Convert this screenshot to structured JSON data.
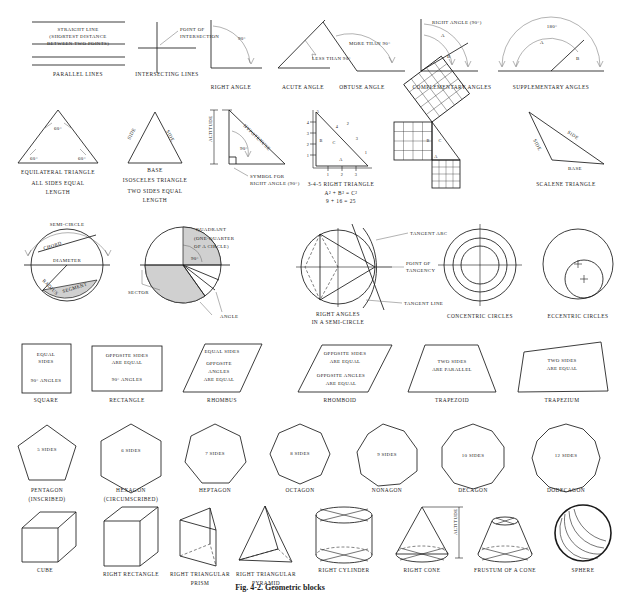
{
  "plate": {
    "caption": "Fig. 4-2. Geometric blocks",
    "background": "#ffffff",
    "ink": "#1a1a1a",
    "shade": "#d0d0d0"
  },
  "row1": {
    "name": "lines-and-angles",
    "items": [
      {
        "id": "parallel-lines",
        "caption": "PARALLEL LINES",
        "labels": [
          "STRAIGHT LINE",
          "(SHORTEST DISTANCE",
          "BETWEEN TWO POINTS)"
        ]
      },
      {
        "id": "intersecting-lines",
        "caption": "INTERSECTING LINES",
        "labels": [
          "POINT OF",
          "INTERSECTION"
        ]
      },
      {
        "id": "right-angle",
        "caption": "RIGHT ANGLE",
        "labels": [
          "90°"
        ]
      },
      {
        "id": "acute-angle",
        "caption": "ACUTE ANGLE",
        "labels": [
          "LESS THAN 90°"
        ]
      },
      {
        "id": "obtuse-angle",
        "caption": "OBTUSE ANGLE",
        "labels": [
          "MORE THAN 90°"
        ]
      },
      {
        "id": "complementary-angles",
        "caption": "COMPLEMENTARY ANGLES",
        "labels": [
          "RIGHT ANGLE (90°)",
          "A",
          "B"
        ]
      },
      {
        "id": "supplementary-angles",
        "caption": "SUPPLEMENTARY ANGLES",
        "labels": [
          "180°",
          "A",
          "B"
        ]
      }
    ]
  },
  "row2": {
    "name": "triangles",
    "items": [
      {
        "id": "equilateral-triangle",
        "caption": "EQUILATERAL TRIANGLE",
        "sub": [
          "ALL SIDES EQUAL",
          "LENGTH"
        ],
        "labels": [
          "60°",
          "60°",
          "60°"
        ]
      },
      {
        "id": "isosceles-triangle",
        "caption": "ISOSCELES TRIANGLE",
        "sub": [
          "TWO SIDES EQUAL",
          "LENGTH"
        ],
        "labels": [
          "SIDE",
          "SIDE",
          "BASE"
        ]
      },
      {
        "id": "right-triangle-altitude",
        "caption": "",
        "labels": [
          "ALTITUDE",
          "HYPOTENUSE",
          "90°",
          "SYMBOL FOR",
          "RIGHT ANGLE (90°)"
        ]
      },
      {
        "id": "three-four-five-right-triangle",
        "caption": "3-4-5 RIGHT TRIANGLE",
        "sub": [
          "A² + B² = C²",
          "9 + 16 = 25"
        ],
        "labels": [
          "A",
          "B",
          "C",
          "1",
          "2",
          "3",
          "4",
          "5"
        ]
      },
      {
        "id": "pythagorean-squares",
        "caption": "",
        "labels": [
          "A",
          "B",
          "C"
        ]
      },
      {
        "id": "scalene-triangle",
        "caption": "SCALENE TRIANGLE",
        "labels": [
          "SIDE",
          "SIDE",
          "BASE"
        ]
      }
    ]
  },
  "row3": {
    "name": "circles",
    "items": [
      {
        "id": "circle-parts",
        "caption": "",
        "labels": [
          "SEMI-CIRCLE",
          "CHORD",
          "DIAMETER",
          "RADIUS",
          "SEGMENT"
        ]
      },
      {
        "id": "circle-sectors",
        "caption": "",
        "labels": [
          "QUADRANT",
          "(ONE-QUARTER",
          "OF A CIRCLE)",
          "90°",
          "SECTOR",
          "ANGLE"
        ]
      },
      {
        "id": "tangents",
        "caption": "RIGHT ANGLES",
        "sub": [
          "IN A SEMI-CIRCLE"
        ],
        "labels": [
          "TANGENT ARC",
          "POINT OF",
          "TANGENCY",
          "TANGENT LINE"
        ]
      },
      {
        "id": "concentric-circles",
        "caption": "CONCENTRIC CIRCLES",
        "labels": []
      },
      {
        "id": "eccentric-circles",
        "caption": "ECCENTRIC CIRCLES",
        "labels": []
      }
    ]
  },
  "row4": {
    "name": "quadrilaterals",
    "items": [
      {
        "id": "square",
        "caption": "SQUARE",
        "labels": [
          "EQUAL",
          "SIDES",
          "90° ANGLES"
        ]
      },
      {
        "id": "rectangle",
        "caption": "RECTANGLE",
        "labels": [
          "OPPOSITE SIDES",
          "ARE EQUAL",
          "90° ANGLES"
        ]
      },
      {
        "id": "rhombus",
        "caption": "RHOMBUS",
        "labels": [
          "EQUAL SIDES",
          "OPPOSITE",
          "ANGLES",
          "ARE EQUAL"
        ]
      },
      {
        "id": "rhomboid",
        "caption": "RHOMBOID",
        "labels": [
          "OPPOSITE SIDES",
          "ARE EQUAL",
          "OPPOSITE ANGLES",
          "ARE EQUAL"
        ]
      },
      {
        "id": "trapezoid",
        "caption": "TRAPEZOID",
        "labels": [
          "TWO SIDES",
          "ARE PARALLEL"
        ]
      },
      {
        "id": "trapezium",
        "caption": "TRAPEZIUM",
        "labels": [
          "TWO SIDES",
          "ARE EQUAL"
        ]
      }
    ]
  },
  "row5": {
    "name": "polygons",
    "items": [
      {
        "id": "pentagon",
        "caption": "PENTAGON",
        "sub": [
          "(INSCRIBED)"
        ],
        "sides_label": "5 SIDES",
        "sides": 5
      },
      {
        "id": "hexagon",
        "caption": "HEXAGON",
        "sub": [
          "(CIRCUMSCRIBED)"
        ],
        "sides_label": "6 SIDES",
        "sides": 6
      },
      {
        "id": "heptagon",
        "caption": "HEPTAGON",
        "sub": [],
        "sides_label": "7 SIDES",
        "sides": 7
      },
      {
        "id": "octagon",
        "caption": "OCTAGON",
        "sub": [],
        "sides_label": "8 SIDES",
        "sides": 8
      },
      {
        "id": "nonagon",
        "caption": "NONAGON",
        "sub": [],
        "sides_label": "9 SIDES",
        "sides": 9
      },
      {
        "id": "decagon",
        "caption": "DECAGON",
        "sub": [],
        "sides_label": "10 SIDES",
        "sides": 10
      },
      {
        "id": "dodecagon",
        "caption": "DODECAGON",
        "sub": [],
        "sides_label": "12 SIDES",
        "sides": 12
      }
    ]
  },
  "row6": {
    "name": "solids",
    "items": [
      {
        "id": "cube",
        "caption": "CUBE",
        "sub": []
      },
      {
        "id": "right-rectangle",
        "caption": "RIGHT RECTANGLE",
        "sub": []
      },
      {
        "id": "right-triangular-prism",
        "caption": "RIGHT TRIANGULAR",
        "sub": [
          "PRISM"
        ]
      },
      {
        "id": "right-triangular-pyramid",
        "caption": "RIGHT TRIANGULAR",
        "sub": [
          "PYRAMID"
        ]
      },
      {
        "id": "right-cylinder",
        "caption": "RIGHT CYLINDER",
        "sub": []
      },
      {
        "id": "right-cone",
        "caption": "RIGHT CONE",
        "sub": [],
        "labels": [
          "ALTITUDE"
        ]
      },
      {
        "id": "frustum-of-a-cone",
        "caption": "FRUSTUM OF A CONE",
        "sub": []
      },
      {
        "id": "sphere",
        "caption": "SPHERE",
        "sub": []
      }
    ]
  }
}
